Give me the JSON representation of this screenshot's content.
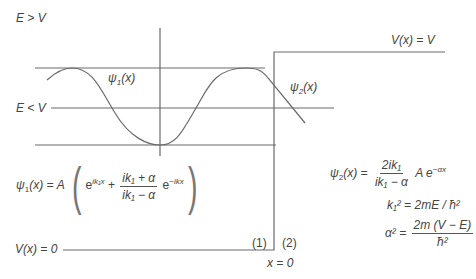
{
  "labels": {
    "e_gt_v": "E > V",
    "e_lt_v": "E < V",
    "v_eq_v": "V(x) = V",
    "v_eq_0": "V(x) = 0",
    "psi1": "ψ",
    "psi1_sub": "1",
    "psi1_arg": "(x)",
    "psi2": "ψ",
    "psi2_sub": "2",
    "psi2_arg": "(x)",
    "region1": "(1)",
    "region2": "(2)",
    "x_eq_0": "x = 0"
  },
  "equations": {
    "psi1_lhs": "ψ",
    "psi1_lhs_sub": "1",
    "psi1_lhs_arg": "(x) = A",
    "psi1_term1": "e",
    "psi1_term1_exp": "ik₁x",
    "psi1_plus": "+",
    "psi1_frac_num": "ik₁ + α",
    "psi1_frac_den": "ik₁ − α",
    "psi1_term2": "e",
    "psi1_term2_exp": "−ikx",
    "psi2_lhs": "ψ",
    "psi2_lhs_sub": "2",
    "psi2_lhs_arg": "(x) =",
    "psi2_frac_num": "2ik₁",
    "psi2_frac_den": "ik₁ − α",
    "psi2_rhs": "A e",
    "psi2_rhs_exp": "−αx",
    "k1_eq": "k₁² = 2mE / ħ²",
    "alpha_lhs": "α² =",
    "alpha_frac_num": "2m (V − E)",
    "alpha_frac_den": "ħ²"
  },
  "colors": {
    "line": "#666666",
    "text": "#444444"
  }
}
